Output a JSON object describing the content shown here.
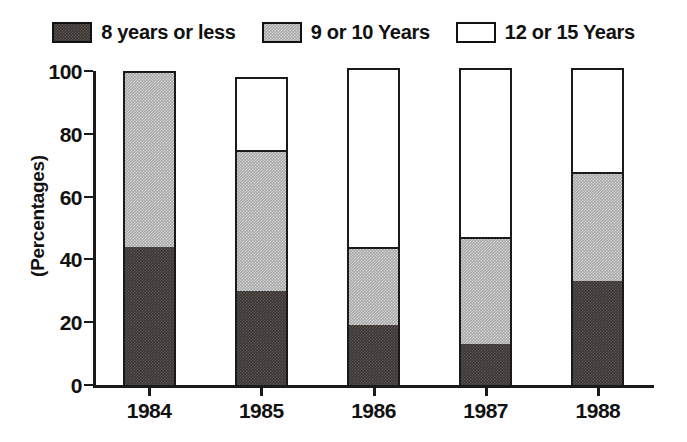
{
  "chart_data": {
    "type": "bar",
    "subtype": "stacked-vertical",
    "title": "",
    "xlabel": "",
    "ylabel": "(Percentages)",
    "categories": [
      "1984",
      "1985",
      "1986",
      "1987",
      "1988"
    ],
    "series": [
      {
        "name": "8 years or less",
        "color": "#3c3734",
        "fill": "dark-dither",
        "values": [
          44,
          30,
          19,
          13,
          33
        ]
      },
      {
        "name": "9 or 10 Years",
        "color": "#a9a9a9",
        "fill": "gray-dither",
        "values": [
          56,
          45,
          25,
          34,
          35
        ]
      },
      {
        "name": "12 or 15 Years",
        "color": "#ffffff",
        "fill": "white",
        "values": [
          0,
          23,
          57,
          54,
          33
        ]
      }
    ],
    "totals": [
      100,
      98,
      101,
      101,
      101
    ],
    "ylim": [
      0,
      100
    ],
    "yticks": [
      0,
      20,
      40,
      60,
      80,
      100
    ],
    "ytick_labels": [
      "0",
      "20",
      "40",
      "60",
      "80",
      "100"
    ],
    "grid": false,
    "legend_position": "top-center"
  },
  "legend": {
    "entries": [
      {
        "label": "8 years or less",
        "swatch": "dark"
      },
      {
        "label": "9 or 10 Years",
        "swatch": "gray"
      },
      {
        "label": "12 or 15 Years",
        "swatch": "white"
      }
    ]
  },
  "axis": {
    "ylabel": "(Percentages)",
    "ytick_labels": [
      "100",
      "80",
      "60",
      "40",
      "20",
      "0"
    ],
    "xtick_labels": [
      "1984",
      "1985",
      "1986",
      "1987",
      "1988"
    ]
  }
}
